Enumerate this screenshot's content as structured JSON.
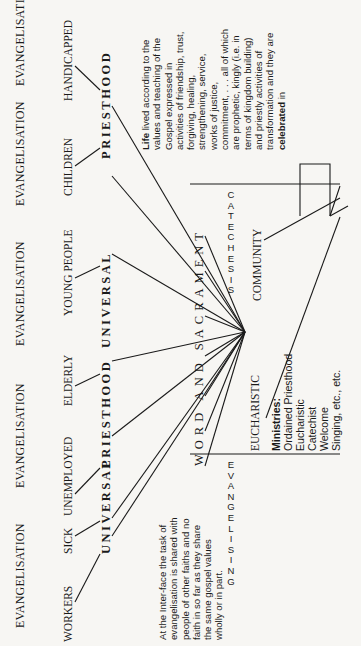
{
  "top_row": {
    "evangelisation_labels": [
      "EVANGELISATION",
      "EVANGELISATION",
      "EVANGELISATION",
      "EVANGELISATION",
      "EVANGELISATION"
    ]
  },
  "groups": [
    "WORKERS",
    "SICK",
    "UNEMPLOYED",
    "ELDERLY",
    "YOUNG PEOPLE",
    "CHILDREN",
    "HANDICAPPED"
  ],
  "priesthood_row": [
    "UNIVERSAL",
    "PRIESTHOOD",
    "UNIVERSAL",
    "PRIESTHOOD",
    "UNIVERSAL",
    "PRIESTHOOD"
  ],
  "left_note": "At the Inter-face the task of\nevangelisation is shared with\npeople of other faiths and no\nfaith in so far as they share\nthe same gospel values\nwholly or in part.",
  "right_note": {
    "lead": "Life",
    "text": " lived according to the\nvalues and teaching of the\nGospel expressed in\nactivities of friendship, trust,\nforgiving, healing,\nstrengthening, service,\nworks of justice,\ncommitment, . . . all of which\nare prophetic, kingly (i.e. in\nterms of kingdom building)\nand priestly activities of\ntransformation and they are\n",
    "celebrated": "celebrated",
    "tail": " in"
  },
  "center": {
    "word_and_sacrament": "WORD AND SACRAMENT",
    "eucharistic": "EUCHARISTIC",
    "community": "COMMUNITY"
  },
  "ministries": {
    "title": "Ministries:",
    "items": [
      "Ordained Priesthood",
      "Eucharistic",
      "Catechist",
      "Welcome",
      "Singing, etc., etc."
    ]
  },
  "side_columns": {
    "evangelising": "E\nV\nA\nN\nG\nE\nL\nI\nS\nI\nN\nG",
    "catechesis": "C\nA\nT\nE\nC\nH\nE\nS\nI\nS"
  }
}
